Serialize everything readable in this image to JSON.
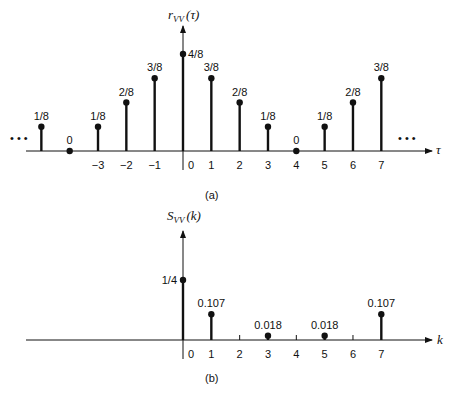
{
  "chart_data": [
    {
      "type": "stem",
      "panel_label": "(a)",
      "title": "",
      "ylabel": "r_VV(τ)",
      "xlabel": "τ",
      "x": [
        -5,
        -4,
        -3,
        -2,
        -1,
        0,
        1,
        2,
        3,
        4,
        5,
        6,
        7
      ],
      "values": [
        0.125,
        0,
        0.125,
        0.25,
        0.375,
        0.5,
        0.375,
        0.25,
        0.125,
        0,
        0.125,
        0.25,
        0.375
      ],
      "value_labels": [
        "1/8",
        "0",
        "1/8",
        "2/8",
        "3/8",
        "4/8",
        "3/8",
        "2/8",
        "1/8",
        "0",
        "1/8",
        "2/8",
        "3/8"
      ],
      "tick_labels": [
        "−3",
        "−2",
        "−1",
        "0",
        "1",
        "2",
        "3",
        "4",
        "5",
        "6",
        "7"
      ],
      "tick_positions": [
        -3,
        -2,
        -1,
        0,
        1,
        2,
        3,
        4,
        5,
        6,
        7
      ],
      "continuation": "• • •",
      "grid": false
    },
    {
      "type": "stem",
      "panel_label": "(b)",
      "title": "",
      "ylabel": "S_VV(k)",
      "xlabel": "k",
      "x": [
        0,
        1,
        3,
        5,
        7
      ],
      "values": [
        0.25,
        0.107,
        0.018,
        0.018,
        0.107
      ],
      "value_labels": [
        "1/4",
        "0.107",
        "0.018",
        "0.018",
        "0.107"
      ],
      "tick_labels": [
        "0",
        "1",
        "2",
        "3",
        "4",
        "5",
        "6",
        "7"
      ],
      "tick_positions": [
        0,
        1,
        2,
        3,
        4,
        5,
        6,
        7
      ],
      "grid": false
    }
  ],
  "labels": {
    "a_ylabel_main": "r",
    "a_ylabel_sub": "VV",
    "a_ylabel_arg": "(τ)",
    "a_xlabel": "τ",
    "a_panel": "(a)",
    "b_ylabel_main": "S",
    "b_ylabel_sub": "VV",
    "b_ylabel_arg": "(k)",
    "b_xlabel": "k",
    "b_panel": "(b)",
    "dots": "• • •"
  }
}
